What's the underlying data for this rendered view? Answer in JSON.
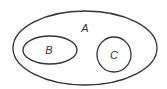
{
  "diagram": {
    "type": "venn-euler",
    "sets": [
      {
        "id": "A",
        "label": "A",
        "contains": [
          "B",
          "C"
        ]
      },
      {
        "id": "B",
        "label": "B",
        "contains": []
      },
      {
        "id": "C",
        "label": "C",
        "contains": []
      }
    ],
    "colors": {
      "stroke": "#333333",
      "background": "#ffffff"
    }
  }
}
